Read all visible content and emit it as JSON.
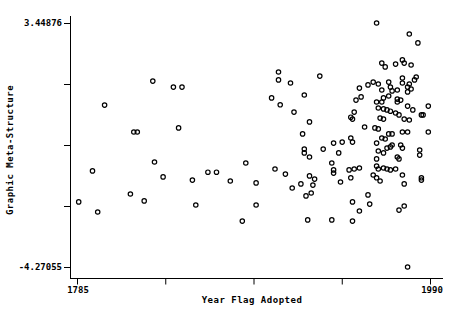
{
  "figure": {
    "background_color": "#ffffff",
    "axis_color": "#000000",
    "marker_color": "#000000"
  },
  "chart_data": {
    "type": "scatter",
    "title": "",
    "xlabel": "Year Flag Adopted",
    "ylabel": "Graphic Meta-Structure",
    "x_min_label": "1785",
    "x_max_label": "1990",
    "y_max_label": "3.44876",
    "y_min_label": "-4.27055",
    "xlim": [
      1785,
      1990
    ],
    "ylim": [
      -4.27055,
      3.44876
    ],
    "x_tick_count": 5,
    "y_tick_count": 5,
    "x_tick_labels": [
      "1785",
      "",
      "",
      "",
      "1990"
    ],
    "y_tick_labels": [
      "3.44876",
      "",
      "",
      "",
      "-4.27055"
    ],
    "grid": false,
    "legend": false,
    "marker": "open-circle",
    "points": [
      [
        1829,
        1.61
      ],
      [
        1841,
        1.42
      ],
      [
        1846,
        1.42
      ],
      [
        1902,
        1.9
      ],
      [
        1902,
        1.65
      ],
      [
        1909,
        1.55
      ],
      [
        1898,
        1.08
      ],
      [
        1917,
        1.17
      ],
      [
        1926,
        1.77
      ],
      [
        1959,
        3.45
      ],
      [
        1978,
        3.1
      ],
      [
        1983,
        2.82
      ],
      [
        1962,
        2.18
      ],
      [
        1964,
        2.06
      ],
      [
        1970,
        2.15
      ],
      [
        1974,
        2.28
      ],
      [
        1975,
        2.18
      ],
      [
        1979,
        2.12
      ],
      [
        1949,
        1.39
      ],
      [
        1950,
        1.11
      ],
      [
        1954,
        1.49
      ],
      [
        1957,
        1.58
      ],
      [
        1960,
        1.52
      ],
      [
        1962,
        1.33
      ],
      [
        1963,
        1.08
      ],
      [
        1966,
        1.14
      ],
      [
        1966,
        1.58
      ],
      [
        1967,
        1.42
      ],
      [
        1968,
        1.3
      ],
      [
        1971,
        1.04
      ],
      [
        1971,
        1.33
      ],
      [
        1974,
        1.55
      ],
      [
        1974,
        1.71
      ],
      [
        1977,
        1.42
      ],
      [
        1977,
        1.27
      ],
      [
        1979,
        1.36
      ],
      [
        1978,
        1.52
      ],
      [
        1981,
        1.65
      ],
      [
        1982,
        1.74
      ],
      [
        1801,
        0.85
      ],
      [
        1818,
        0.0
      ],
      [
        1820,
        0.0
      ],
      [
        1844,
        0.13
      ],
      [
        1830,
        -0.95
      ],
      [
        1835,
        -1.42
      ],
      [
        1794,
        -1.23
      ],
      [
        1903,
        0.86
      ],
      [
        1911,
        0.63
      ],
      [
        1920,
        0.32
      ],
      [
        1916,
        -0.06
      ],
      [
        1917,
        -0.54
      ],
      [
        1917,
        -0.66
      ],
      [
        1920,
        -0.79
      ],
      [
        1928,
        -0.54
      ],
      [
        1883,
        -0.98
      ],
      [
        1900,
        -1.17
      ],
      [
        1906,
        -1.33
      ],
      [
        1861,
        -1.27
      ],
      [
        1866,
        -1.27
      ],
      [
        1852,
        -1.52
      ],
      [
        1874,
        -1.55
      ],
      [
        1889,
        -1.61
      ],
      [
        1915,
        -1.64
      ],
      [
        1920,
        -1.39
      ],
      [
        1923,
        -1.49
      ],
      [
        1922,
        -1.68
      ],
      [
        1910,
        -1.77
      ],
      [
        1947,
        1.01
      ],
      [
        1973,
        1.01
      ],
      [
        1989,
        0.82
      ],
      [
        1959,
        0.95
      ],
      [
        1962,
        0.95
      ],
      [
        1971,
        0.95
      ],
      [
        1977,
        0.82
      ],
      [
        1980,
        0.7
      ],
      [
        1960,
        0.76
      ],
      [
        1963,
        0.73
      ],
      [
        1965,
        0.7
      ],
      [
        1967,
        0.66
      ],
      [
        1970,
        0.6
      ],
      [
        1972,
        0.54
      ],
      [
        1946,
        0.63
      ],
      [
        1944,
        0.47
      ],
      [
        1945,
        0.41
      ],
      [
        1961,
        0.44
      ],
      [
        1963,
        0.41
      ],
      [
        1975,
        0.41
      ],
      [
        1978,
        0.38
      ],
      [
        1985,
        0.54
      ],
      [
        1986,
        0.54
      ],
      [
        1952,
        0.16
      ],
      [
        1958,
        0.13
      ],
      [
        1960,
        0.1
      ],
      [
        1966,
        -0.06
      ],
      [
        1968,
        -0.06
      ],
      [
        1974,
        0.0
      ],
      [
        1977,
        0.0
      ],
      [
        1989,
        0.0
      ],
      [
        1962,
        -0.19
      ],
      [
        1964,
        -0.22
      ],
      [
        1959,
        -0.35
      ],
      [
        1944,
        -0.19
      ],
      [
        1945,
        -0.32
      ],
      [
        1934,
        -0.35
      ],
      [
        1939,
        -0.32
      ],
      [
        1933,
        -0.98
      ],
      [
        1934,
        -1.2
      ],
      [
        1934,
        -1.3
      ],
      [
        1937,
        -0.66
      ],
      [
        1984,
        -0.57
      ],
      [
        1985,
        -1.52
      ],
      [
        1938,
        -1.58
      ],
      [
        1960,
        -0.6
      ],
      [
        1963,
        -0.66
      ],
      [
        1965,
        -0.51
      ],
      [
        1967,
        -0.47
      ],
      [
        1968,
        -0.41
      ],
      [
        1973,
        -0.41
      ],
      [
        1974,
        -0.51
      ],
      [
        1971,
        -0.79
      ],
      [
        1972,
        -0.85
      ],
      [
        1959,
        -0.85
      ],
      [
        1946,
        -1.17
      ],
      [
        1959,
        -1.08
      ],
      [
        1960,
        -1.17
      ],
      [
        1963,
        -1.14
      ],
      [
        1965,
        -1.17
      ],
      [
        1967,
        -1.2
      ],
      [
        1970,
        -1.17
      ],
      [
        1957,
        -1.36
      ],
      [
        1959,
        -1.45
      ],
      [
        1961,
        -1.55
      ],
      [
        1974,
        -1.36
      ],
      [
        1975,
        -1.64
      ],
      [
        1984,
        -0.73
      ],
      [
        1944,
        -1.45
      ],
      [
        1985,
        -1.45
      ],
      [
        1943,
        -1.2
      ],
      [
        1949,
        -1.14
      ],
      [
        1786,
        -2.21
      ],
      [
        1797,
        -2.53
      ],
      [
        1816,
        -1.96
      ],
      [
        1824,
        -2.18
      ],
      [
        1854,
        -2.31
      ],
      [
        1889,
        -2.31
      ],
      [
        1881,
        -2.82
      ],
      [
        1918,
        -2.02
      ],
      [
        1921,
        -1.93
      ],
      [
        1919,
        -2.78
      ],
      [
        1954,
        -1.99
      ],
      [
        1945,
        -2.21
      ],
      [
        1955,
        -2.28
      ],
      [
        1949,
        -2.5
      ],
      [
        1945,
        -2.82
      ],
      [
        1933,
        -2.78
      ],
      [
        1972,
        -2.47
      ],
      [
        1975,
        -2.34
      ],
      [
        1977,
        -4.27
      ]
    ]
  }
}
